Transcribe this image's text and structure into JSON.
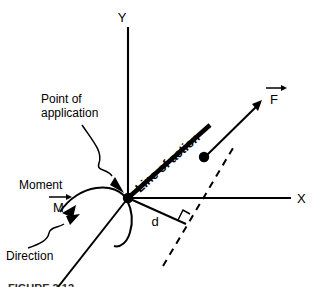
{
  "figure": {
    "domain": "Diagram",
    "background_color": "#ffffff",
    "ink_color": "#000000"
  },
  "axes": {
    "y_label": "Y",
    "x_label": "X",
    "origin_label": "origin"
  },
  "labels": {
    "point_of_application_line1": "Point of",
    "point_of_application_line2": "application",
    "moment": "Moment",
    "moment_symbol": "M",
    "direction": "Direction",
    "line_of_action": "Line of action",
    "force_symbol": "F",
    "distance_symbol": "d",
    "right_angle": "right-angle mark"
  },
  "caption": {
    "text": "FIGURE 2.12"
  },
  "annotations": [
    {
      "name": "point-of-application-arrow",
      "kind": "wavy-leader-arrow",
      "from": "Point of application label",
      "to": "origin point"
    },
    {
      "name": "direction-arrow",
      "kind": "wavy-leader-arrow",
      "from": "Direction label",
      "to": "moment arc"
    },
    {
      "name": "moment-arc",
      "kind": "curved-arrow",
      "description": "curved rotation arc with arrowhead pointing down-left"
    },
    {
      "name": "force-vector",
      "kind": "straight-arrow",
      "description": "arrow from application dot pointing up-right"
    },
    {
      "name": "perpendicular-distance",
      "kind": "segment",
      "description": "segment d from origin meeting dashed line at a right angle"
    }
  ]
}
